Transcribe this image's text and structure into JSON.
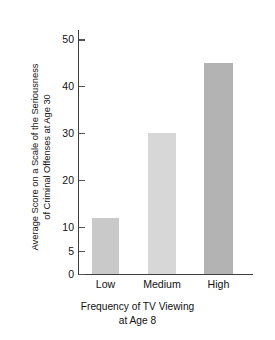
{
  "chart_data": {
    "type": "bar",
    "title": "",
    "categories": [
      "Low",
      "Medium",
      "High"
    ],
    "values": [
      12,
      30,
      45
    ],
    "series": [
      {
        "name": "Average score on a scale of the seriousness of criminal offenses at age 30",
        "values": [
          12,
          30,
          45
        ]
      }
    ],
    "xlabel": "Frequency of TV Viewing at Age 8",
    "xlabel_lines": [
      "Frequency of TV Viewing",
      "at Age 8"
    ],
    "ylabel": "Average Score on a Scale of the Seriousness of Criminal Offenses at Age 30",
    "ylabel_lines": [
      "Average Score on a Scale of the Seriousness",
      "of Criminal Offenses at Age 30"
    ],
    "ylim": [
      0,
      52
    ],
    "yticks": [
      0,
      5,
      10,
      20,
      30,
      40,
      50
    ],
    "ytick_labels": [
      "0",
      "5",
      "10",
      "20",
      "30",
      "40",
      "50"
    ],
    "grid": false,
    "legend": false,
    "bar_colors": [
      "#c9c9c9",
      "#d7d7d7",
      "#b3b3b3"
    ],
    "axis_color": "#3d3d3d",
    "text_color": "#111111"
  }
}
